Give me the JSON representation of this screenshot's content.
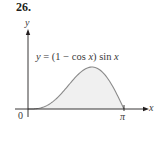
{
  "problem": {
    "number": "26."
  },
  "chart_data": {
    "type": "area",
    "title": "",
    "function_label": "y = (1 − cos x) sin x",
    "function_label_parts": {
      "lhs": "y",
      "eq": " = (1 − cos ",
      "var1": "x",
      "mid": ") sin ",
      "var2": "x"
    },
    "xlabel": "x",
    "ylabel": "y",
    "x_ticks": [
      {
        "value": 0,
        "label": "0"
      },
      {
        "value": 3.14159,
        "label": "π"
      }
    ],
    "xlim": [
      0,
      3.14159
    ],
    "ylim": [
      0,
      1.5
    ],
    "grid": false,
    "shaded_region": "area under curve from x = 0 to x = π",
    "x": [
      0,
      0.3927,
      0.7854,
      1.1781,
      1.5708,
      1.9635,
      2.0944,
      2.3562,
      2.7489,
      3.14159
    ],
    "values": [
      0,
      0.0294,
      0.2071,
      0.574,
      1.0,
      1.2889,
      1.299,
      1.2071,
      0.8949,
      0
    ],
    "peak": {
      "x": 2.0944,
      "y": 1.299
    },
    "colors": {
      "curve": "#8a8a8a",
      "fill": "#f0f0f0",
      "axis": "#231f20"
    }
  }
}
